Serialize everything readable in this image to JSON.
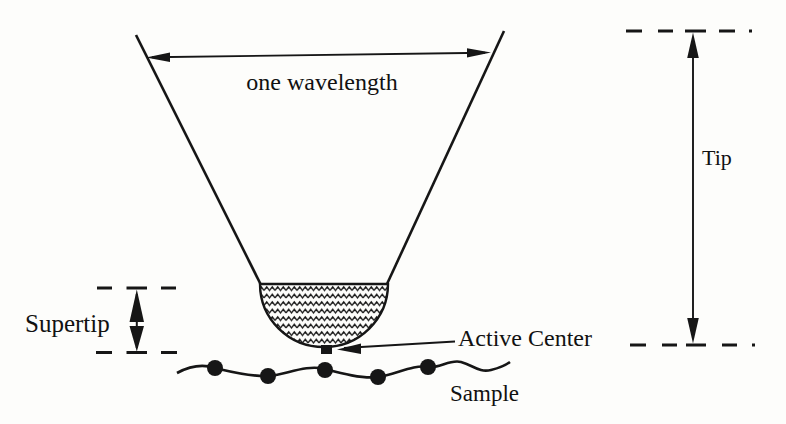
{
  "figure": {
    "labels": {
      "wavelength": "one wavelength",
      "supertip": "Supertip",
      "active_center": "Active Center",
      "sample": "Sample",
      "tip": "Tip"
    },
    "sample": {
      "molecule_count": 5
    },
    "colors": {
      "ink": "#161616",
      "background": "#fdfdfb"
    }
  }
}
